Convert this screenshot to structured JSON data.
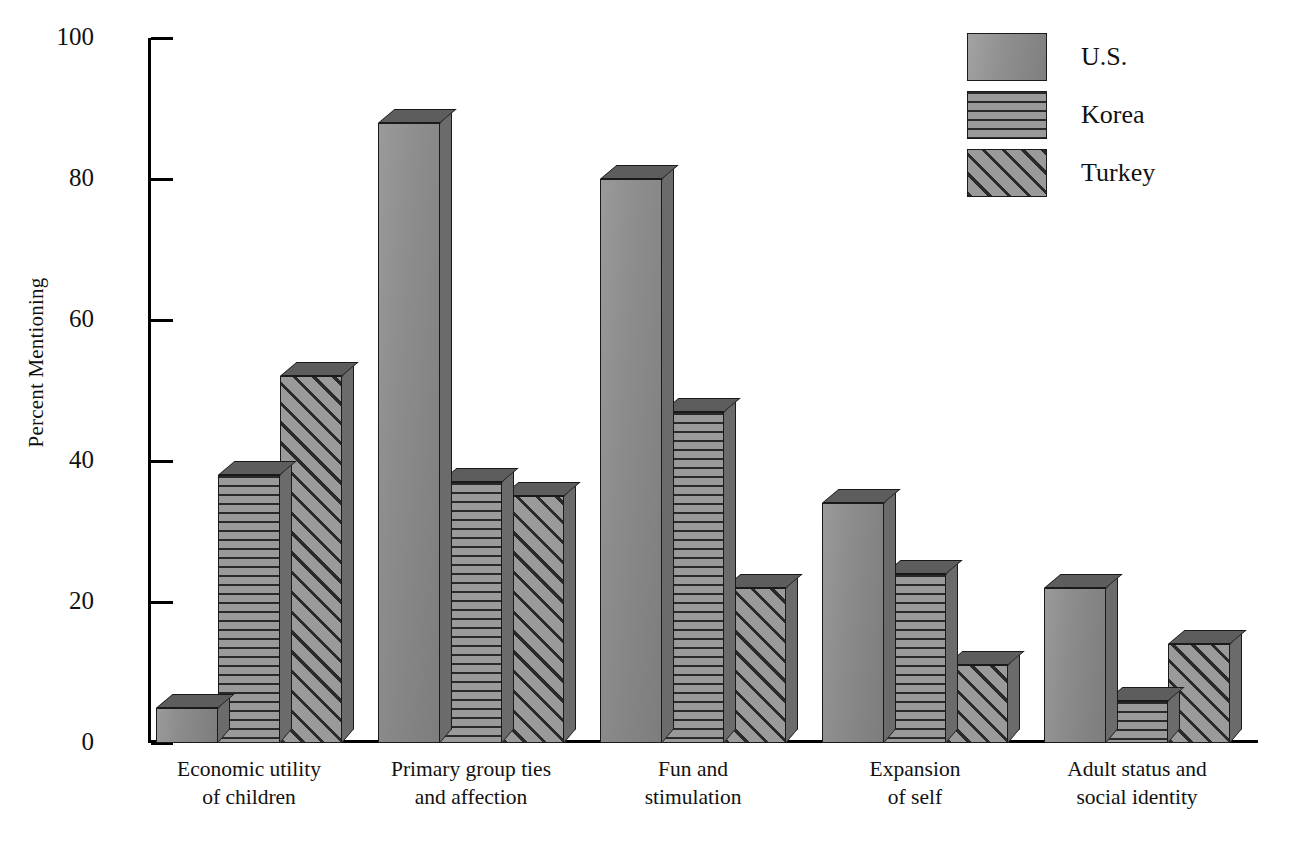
{
  "chart_data": {
    "type": "bar",
    "title": "",
    "subtitle": "",
    "xlabel": "",
    "ylabel": "Percent Mentioning",
    "ylim": [
      0,
      100
    ],
    "yticks": [
      0,
      20,
      40,
      60,
      80,
      100
    ],
    "ytick_labels": [
      "0",
      "20",
      "40",
      "60",
      "80",
      "100"
    ],
    "grid": false,
    "legend_position": "top-right",
    "categories": [
      "Economic utility of children",
      "Primary group ties and affection",
      "Fun and stimulation",
      "Expansion of self",
      "Adult status and social identity"
    ],
    "category_lines": [
      [
        "Economic utility",
        "of children"
      ],
      [
        "Primary group ties",
        "and affection"
      ],
      [
        "Fun and",
        "stimulation"
      ],
      [
        "Expansion",
        "of self"
      ],
      [
        "Adult status and",
        "social identity"
      ]
    ],
    "series": [
      {
        "name": "U.S.",
        "pattern": "solid-gray",
        "values": [
          5,
          88,
          80,
          34,
          22
        ]
      },
      {
        "name": "Korea",
        "pattern": "horizontal-stripes",
        "values": [
          38,
          37,
          47,
          24,
          6
        ]
      },
      {
        "name": "Turkey",
        "pattern": "diagonal-stripes",
        "values": [
          52,
          35,
          22,
          11,
          14
        ]
      }
    ]
  },
  "legend": {
    "items": [
      {
        "label": "U.S.",
        "swatch": "solid-gray-swatch"
      },
      {
        "label": "Korea",
        "swatch": "horizontal-stripe-swatch"
      },
      {
        "label": "Turkey",
        "swatch": "diagonal-stripe-swatch"
      }
    ]
  },
  "axes": {
    "y_title": "Percent Mentioning",
    "y_tick_labels": [
      "100",
      "80",
      "60",
      "40",
      "20",
      "0"
    ]
  },
  "colors": {
    "bar_fill": "#8b8b8b",
    "bar_top": "#5d5d5d",
    "bar_side": "#6b6b6b",
    "outline": "#1a1a1a",
    "text": "#111111",
    "background": "#ffffff"
  }
}
